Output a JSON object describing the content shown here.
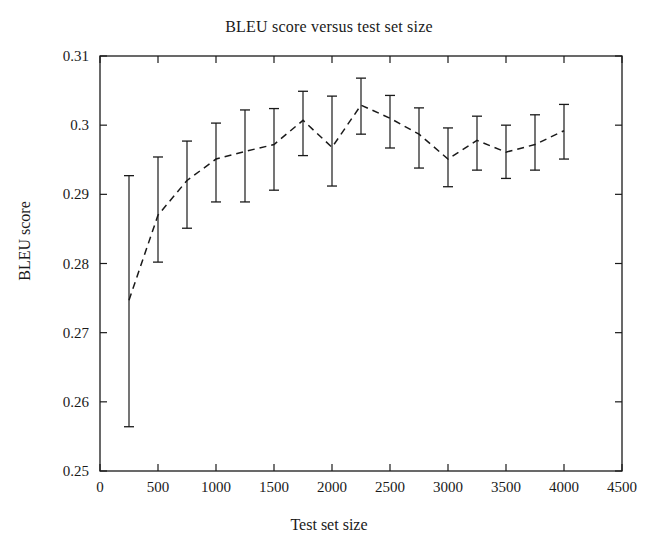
{
  "chart_data": {
    "type": "line",
    "title": "BLEU score versus test set size",
    "xlabel": "Test set size",
    "ylabel": "BLEU score",
    "xlim": [
      0,
      4500
    ],
    "ylim": [
      0.25,
      0.31
    ],
    "xticks": [
      0,
      500,
      1000,
      1500,
      2000,
      2500,
      3000,
      3500,
      4000,
      4500
    ],
    "xtick_labels": [
      "0",
      "500",
      "1000",
      "1500",
      "2000",
      "2500",
      "3000",
      "3500",
      "4000",
      "4500"
    ],
    "yticks": [
      0.25,
      0.26,
      0.27,
      0.28,
      0.29,
      0.3,
      0.31
    ],
    "ytick_labels": [
      "0.25",
      "0.26",
      "0.27",
      "0.28",
      "0.29",
      "0.3",
      "0.31"
    ],
    "grid": false,
    "legend": false,
    "line_style": "dashed",
    "marker": "none",
    "error_bars": true,
    "line_color": "#1a1a1a",
    "series": [
      {
        "name": "BLEU score",
        "x": [
          250,
          500,
          750,
          1000,
          1250,
          1500,
          1750,
          2000,
          2250,
          2500,
          2750,
          3000,
          3250,
          3500,
          3750,
          4000
        ],
        "values": [
          0.2747,
          0.287,
          0.292,
          0.2951,
          0.2962,
          0.2972,
          0.3007,
          0.2968,
          0.3029,
          0.301,
          0.2987,
          0.2951,
          0.2978,
          0.2961,
          0.2972,
          0.2992
        ],
        "err_low": [
          0.2564,
          0.2802,
          0.2851,
          0.2889,
          0.2889,
          0.2906,
          0.2956,
          0.2912,
          0.2987,
          0.2967,
          0.2938,
          0.2911,
          0.2935,
          0.2923,
          0.2935,
          0.2951
        ],
        "err_high": [
          0.2927,
          0.2954,
          0.2977,
          0.3003,
          0.3022,
          0.3024,
          0.3049,
          0.3042,
          0.3068,
          0.3043,
          0.3025,
          0.2996,
          0.3013,
          0.3,
          0.3015,
          0.303
        ]
      }
    ]
  }
}
